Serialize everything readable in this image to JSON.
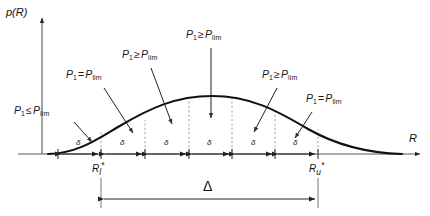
{
  "figure": {
    "type": "annotated-plot",
    "axes": {
      "y_label": "p(R)",
      "x_label": "R",
      "y_axis_x": 42,
      "x_axis_y": 154,
      "x_axis_x0": 18,
      "x_axis_x1": 424,
      "y_axis_y0": 14,
      "y_axis_y1": 154
    },
    "curve": {
      "description": "bell-shaped probability density",
      "start_x": 48,
      "end_x": 402,
      "peak_x": 212,
      "peak_y": 96,
      "baseline_y": 154
    },
    "bins": {
      "label": "δ",
      "count": 6,
      "boundaries_x": [
        58,
        101,
        145,
        189,
        232,
        275,
        318
      ],
      "dotted_guides_x": [
        101,
        145,
        189,
        232,
        275,
        318
      ]
    },
    "boundary_marks": [
      {
        "name": "lower-bound",
        "R": "R",
        "sub": "l",
        "sup": "*",
        "x": 101
      },
      {
        "name": "upper-bound",
        "R": "R",
        "sub": "u",
        "sup": "*",
        "x": 318
      }
    ],
    "span": {
      "label": "Δ",
      "from_x": 101,
      "to_x": 318,
      "y": 196
    },
    "annotations": [
      {
        "id": "a1",
        "p": "P",
        "sub": "1",
        "rel": "≤",
        "plim": "P",
        "plim_sub": "lim",
        "text": "P1 ≤ Plim",
        "x": 14,
        "y": 110,
        "arrow": {
          "x1": 74,
          "y1": 122,
          "x2": 92,
          "y2": 142
        }
      },
      {
        "id": "a2",
        "p": "P",
        "sub": "1",
        "rel": "=",
        "plim": "P",
        "plim_sub": "lim",
        "text": "P1 = Plim",
        "x": 66,
        "y": 74,
        "arrow": {
          "x1": 104,
          "y1": 88,
          "x2": 133,
          "y2": 133
        }
      },
      {
        "id": "a3",
        "p": "P",
        "sub": "1",
        "rel": "≥",
        "plim": "P",
        "plim_sub": "lim",
        "text": "P1 ≥ Plim",
        "x": 122,
        "y": 54,
        "arrow": {
          "x1": 151,
          "y1": 68,
          "x2": 172,
          "y2": 124
        }
      },
      {
        "id": "a4",
        "p": "P",
        "sub": "1",
        "rel": "≥",
        "plim": "P",
        "plim_sub": "lim",
        "text": "P1 ≥ Plim",
        "x": 186,
        "y": 34,
        "arrow": {
          "x1": 211,
          "y1": 48,
          "x2": 211,
          "y2": 118
        }
      },
      {
        "id": "a5",
        "p": "P",
        "sub": "1",
        "rel": "≥",
        "plim": "P",
        "plim_sub": "lim",
        "text": "P1 ≥ Plim",
        "x": 262,
        "y": 74,
        "arrow": {
          "x1": 277,
          "y1": 88,
          "x2": 254,
          "y2": 132
        }
      },
      {
        "id": "a6",
        "p": "P",
        "sub": "1",
        "rel": "=",
        "plim": "P",
        "plim_sub": "lim",
        "text": "P1 = Plim",
        "x": 306,
        "y": 98,
        "arrow": {
          "x1": 312,
          "y1": 112,
          "x2": 295,
          "y2": 138
        }
      }
    ],
    "colors": {
      "curve": "#111111",
      "axis": "#444444",
      "guide": "#888888",
      "text": "#1a1a1a"
    }
  }
}
